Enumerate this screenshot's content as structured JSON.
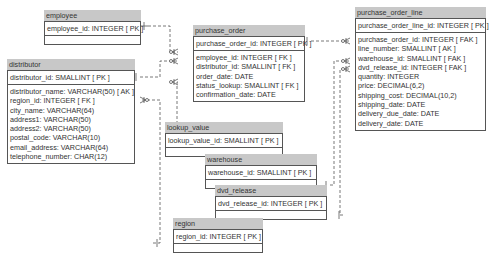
{
  "entities": {
    "employee": {
      "name": "employee",
      "pk": "employee_id: INTEGER  [ PK ]",
      "attrs": []
    },
    "distributor": {
      "name": "distributor",
      "pk": "distributor_id: SMALLINT  [ PK ]",
      "attrs": [
        "distributor_name: VARCHAR(50)  [ AK ]",
        "region_id: INTEGER  [ FK ]",
        "city_name: VARCHAR(64)",
        "address1: VARCHAR(50)",
        "address2: VARCHAR(50)",
        "postal_code: VARCHAR(10)",
        "email_address: VARCHAR(64)",
        "telephone_number: CHAR(12)"
      ]
    },
    "purchase_order": {
      "name": "purchase_order",
      "pk": "purchase_order_id: INTEGER  [ PK ]",
      "attrs": [
        "employee_id: INTEGER  [ FK ]",
        "distributor_id: SMALLINT  [ FK ]",
        "order_date: DATE",
        "status_lookup: SMALLINT  [ FK ]",
        "confirmation_date: DATE"
      ]
    },
    "purchase_order_line": {
      "name": "purchase_order_line",
      "pk": "purchase_order_line_id: INTEGER  [ PK ]",
      "attrs": [
        "purchase_order_id: INTEGER  [ FAK ]",
        "line_number: SMALLINT  [ AK ]",
        "warehouse_id: SMALLINT  [ FAK ]",
        "dvd_release_id: INTEGER  [ FAK ]",
        "quantity: INTEGER",
        "price: DECIMAL(6,2)",
        "shipping_cost: DECIMAL(10,2)",
        "shipping_date: DATE",
        "delivery_due_date: DATE",
        "delivery_date: DATE"
      ]
    },
    "lookup_value": {
      "name": "lookup_value",
      "pk": "lookup_value_id: SMALLINT  [ PK ]",
      "attrs": []
    },
    "warehouse": {
      "name": "warehouse",
      "pk": "warehouse_id: SMALLINT  [ PK ]",
      "attrs": []
    },
    "dvd_release": {
      "name": "dvd_release",
      "pk": "dvd_release_id: INTEGER  [ PK ]",
      "attrs": []
    },
    "region": {
      "name": "region",
      "pk": "region_id: INTEGER  [ PK ]",
      "attrs": []
    }
  },
  "colors": {
    "header": "#c8c8c8",
    "border": "#555555",
    "line": "#555555"
  }
}
